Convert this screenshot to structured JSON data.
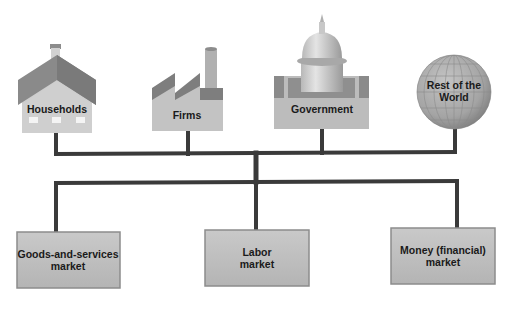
{
  "diagram": {
    "type": "economy-participants-and-markets",
    "participants": [
      {
        "id": "households",
        "label": "Households",
        "icon": "house-icon"
      },
      {
        "id": "firms",
        "label": "Firms",
        "icon": "factory-icon"
      },
      {
        "id": "government",
        "label": "Government",
        "icon": "capitol-building-icon"
      },
      {
        "id": "rest-of-world",
        "label_line1": "Rest of the",
        "label_line2": "World",
        "icon": "globe-icon"
      }
    ],
    "markets": [
      {
        "id": "goods",
        "label_line1": "Goods-and-services",
        "label_line2": "market"
      },
      {
        "id": "labor",
        "label_line1": "Labor",
        "label_line2": "market"
      },
      {
        "id": "money",
        "label_line1": "Money (financial)",
        "label_line2": "market"
      }
    ],
    "colors": {
      "connector": "#3a3a3a",
      "box_fill": "#bdbdbd",
      "box_border": "#8c8c8c",
      "roof": "#8a8a8a",
      "wall": "#c8c8c8",
      "globe": "#a8a8a8"
    }
  }
}
